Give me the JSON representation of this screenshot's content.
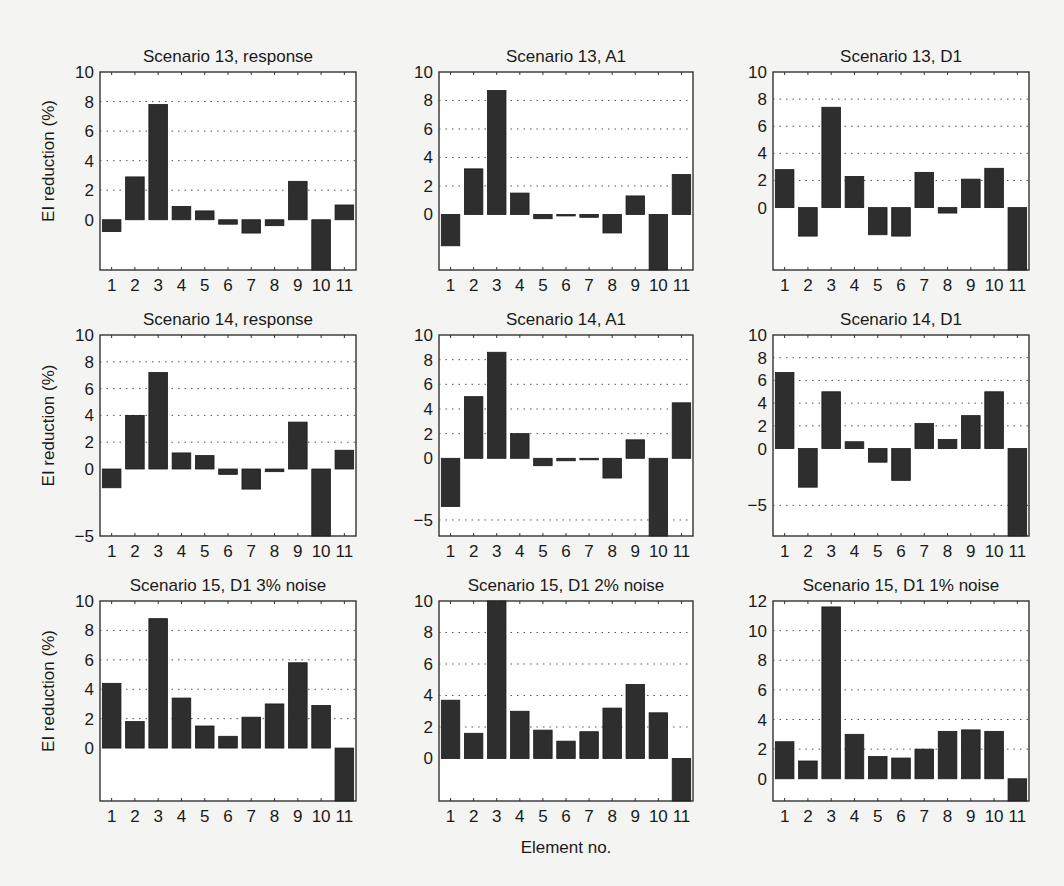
{
  "figure": {
    "xlabel": "Element no.",
    "ylabel": "EI reduction (%)"
  },
  "chart_data": [
    {
      "type": "bar",
      "title": "Scenario 13, response",
      "xlabel": "",
      "ylabel": "EI reduction (%)",
      "categories": [
        "1",
        "2",
        "3",
        "4",
        "5",
        "6",
        "7",
        "8",
        "9",
        "10",
        "11"
      ],
      "values": [
        -0.8,
        2.9,
        7.8,
        0.9,
        0.6,
        -0.3,
        -0.9,
        -0.4,
        2.6,
        -3.4,
        1.0
      ],
      "ylim": [
        -3.4,
        10
      ],
      "yticks": [
        0,
        2,
        4,
        6,
        8,
        10
      ],
      "grid": true
    },
    {
      "type": "bar",
      "title": "Scenario 13, A1",
      "xlabel": "",
      "ylabel": "",
      "categories": [
        "1",
        "2",
        "3",
        "4",
        "5",
        "6",
        "7",
        "8",
        "9",
        "10",
        "11"
      ],
      "values": [
        -2.2,
        3.2,
        8.7,
        1.5,
        -0.3,
        -0.1,
        -0.2,
        -1.3,
        1.3,
        -3.9,
        2.8
      ],
      "ylim": [
        -3.9,
        10
      ],
      "yticks": [
        0,
        2,
        4,
        6,
        8,
        10
      ],
      "grid": true
    },
    {
      "type": "bar",
      "title": "Scenario 13, D1",
      "xlabel": "",
      "ylabel": "",
      "categories": [
        "1",
        "2",
        "3",
        "4",
        "5",
        "6",
        "7",
        "8",
        "9",
        "10",
        "11"
      ],
      "values": [
        2.8,
        -2.1,
        7.4,
        2.3,
        -2.0,
        -2.1,
        2.6,
        -0.4,
        2.1,
        2.9,
        -4.6
      ],
      "ylim": [
        -4.6,
        10
      ],
      "yticks": [
        0,
        2,
        4,
        6,
        8,
        10
      ],
      "grid": true
    },
    {
      "type": "bar",
      "title": "Scenario 14, response",
      "xlabel": "",
      "ylabel": "EI reduction (%)",
      "categories": [
        "1",
        "2",
        "3",
        "4",
        "5",
        "6",
        "7",
        "8",
        "9",
        "10",
        "11"
      ],
      "values": [
        -1.4,
        4.0,
        7.2,
        1.2,
        1.0,
        -0.4,
        -1.5,
        -0.2,
        3.5,
        -5.0,
        1.4
      ],
      "ylim": [
        -5,
        10
      ],
      "yticks": [
        -5,
        0,
        2,
        4,
        6,
        8,
        10
      ],
      "grid": true
    },
    {
      "type": "bar",
      "title": "Scenario 14, A1",
      "xlabel": "",
      "ylabel": "",
      "categories": [
        "1",
        "2",
        "3",
        "4",
        "5",
        "6",
        "7",
        "8",
        "9",
        "10",
        "11"
      ],
      "values": [
        -3.9,
        5.0,
        8.6,
        2.0,
        -0.6,
        -0.2,
        -0.05,
        -1.6,
        1.5,
        -6.3,
        4.5
      ],
      "ylim": [
        -6.3,
        10
      ],
      "yticks": [
        -5,
        0,
        2,
        4,
        6,
        8,
        10
      ],
      "grid": true
    },
    {
      "type": "bar",
      "title": "Scenario 14, D1",
      "xlabel": "",
      "ylabel": "",
      "categories": [
        "1",
        "2",
        "3",
        "4",
        "5",
        "6",
        "7",
        "8",
        "9",
        "10",
        "11"
      ],
      "values": [
        6.7,
        -3.4,
        5.0,
        0.6,
        -1.2,
        -2.8,
        2.2,
        0.8,
        2.9,
        5.0,
        -7.7
      ],
      "ylim": [
        -7.7,
        10
      ],
      "yticks": [
        -5,
        0,
        2,
        4,
        6,
        8,
        10
      ],
      "grid": true
    },
    {
      "type": "bar",
      "title": "Scenario 15, D1 3% noise",
      "xlabel": "",
      "ylabel": "EI reduction (%)",
      "categories": [
        "1",
        "2",
        "3",
        "4",
        "5",
        "6",
        "7",
        "8",
        "9",
        "10",
        "11"
      ],
      "values": [
        4.4,
        1.8,
        8.8,
        3.4,
        1.5,
        0.8,
        2.1,
        3.0,
        5.8,
        2.9,
        -3.6
      ],
      "ylim": [
        -3.6,
        10
      ],
      "yticks": [
        0,
        2,
        4,
        6,
        8,
        10
      ],
      "grid": true
    },
    {
      "type": "bar",
      "title": "Scenario 15, D1 2% noise",
      "xlabel": "Element no.",
      "ylabel": "",
      "categories": [
        "1",
        "2",
        "3",
        "4",
        "5",
        "6",
        "7",
        "8",
        "9",
        "10",
        "11"
      ],
      "values": [
        3.7,
        1.6,
        10.0,
        3.0,
        1.8,
        1.1,
        1.7,
        3.2,
        4.7,
        2.9,
        -2.7
      ],
      "ylim": [
        -2.7,
        10
      ],
      "yticks": [
        0,
        2,
        4,
        6,
        8,
        10
      ],
      "grid": true
    },
    {
      "type": "bar",
      "title": "Scenario 15, D1 1% noise",
      "xlabel": "",
      "ylabel": "",
      "categories": [
        "1",
        "2",
        "3",
        "4",
        "5",
        "6",
        "7",
        "8",
        "9",
        "10",
        "11"
      ],
      "values": [
        2.5,
        1.2,
        11.6,
        3.0,
        1.5,
        1.4,
        2.0,
        3.2,
        3.3,
        3.2,
        -1.5
      ],
      "ylim": [
        -1.5,
        12
      ],
      "yticks": [
        0,
        2,
        4,
        6,
        8,
        10,
        12
      ],
      "grid": true
    }
  ],
  "layout": {
    "columns": [
      [
        100,
        356
      ],
      [
        439,
        693
      ],
      [
        773,
        1029
      ]
    ],
    "rows": [
      [
        72,
        270
      ],
      [
        335,
        536
      ],
      [
        601,
        801
      ]
    ]
  }
}
